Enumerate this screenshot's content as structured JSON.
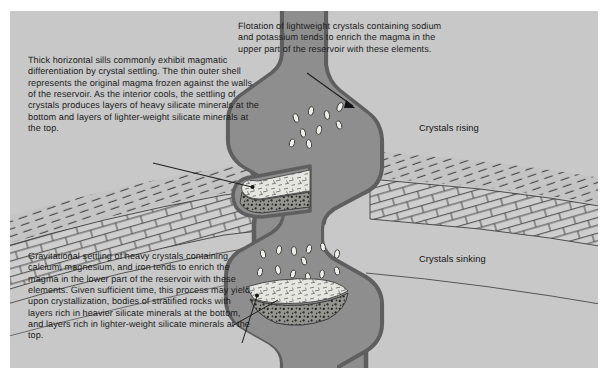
{
  "figure": {
    "type": "geological-cross-section",
    "background_color": "#c8c8c8",
    "magma_color": "#8e8e8e",
    "magma_outline_color": "#6f6f6f",
    "crystal_color": "#e8e8e4",
    "line_color": "#2a2a2a"
  },
  "captions": {
    "sills": "Thick horizontal sills commonly exhibit magmatic differentiation by crystal settling. The thin outer shell represents the original magma frozen against the walls of the reservoir. As the interior cools, the settling of crystals produces layers of heavy silicate minerals at the bottom and layers of lighter-weight silicate minerals at the top.",
    "flotation": "Flotation of lightweight crystals containing sodium and potassium tends to enrich the magma in the upper part of the reservoir with these elements.",
    "gravitational": "Gravitational settling of heavy crystals containing calcium, magnesium, and iron tends to enrich the magma in the lower part of the reservoir with these elements. Given sufficient time, this process may yield, upon crystallization, bodies of stratified rocks with layers rich in heavier silicate minerals at the bottom, and layers rich in lighter-weight silicate minerals at the top."
  },
  "labels": {
    "crystals_rising": "Crystals rising",
    "crystals_sinking": "Crystals sinking"
  },
  "icons": {
    "leader_line_sills": "leader-line-icon",
    "leader_line_flotation": "leader-line-arrow-icon",
    "leader_line_gravitational_upper": "leader-line-icon",
    "leader_line_gravitational_lower": "leader-line-icon"
  },
  "rock_units": {
    "hatched_strata": "inclined dashed bedding strata",
    "brick_strata": "brick-patterned limestone bed",
    "sill_cumulate_top": "light-weight silicate crystal layer",
    "sill_cumulate_bottom": "heavy silicate mineral layer"
  }
}
